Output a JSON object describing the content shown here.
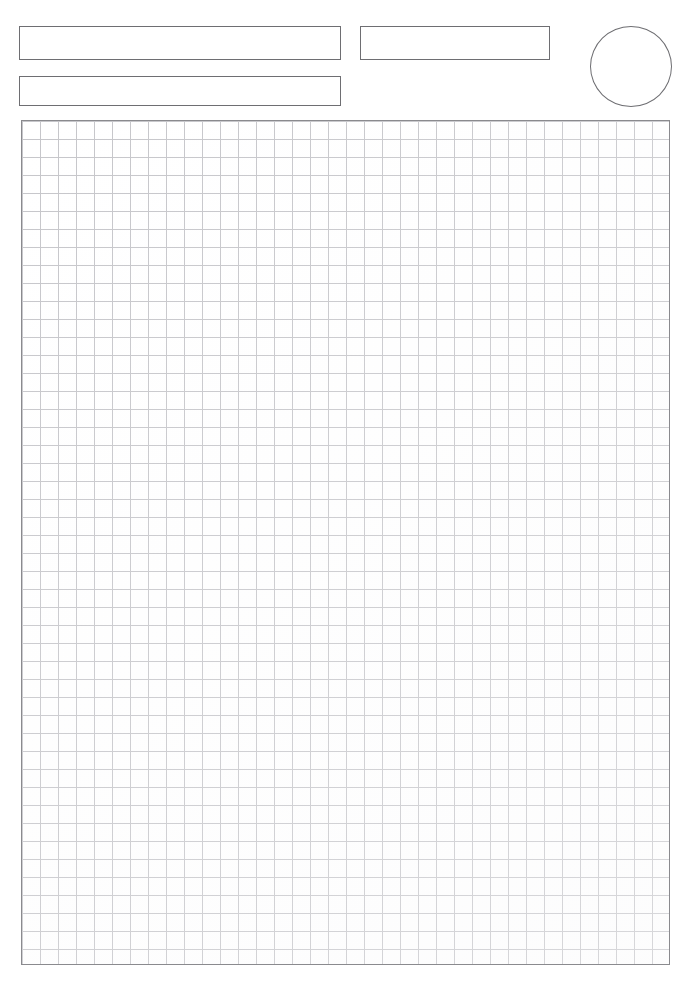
{
  "document": {
    "kind": "blank-grid-worksheet",
    "page_background": "#ffffff",
    "width_px": 697,
    "height_px": 986
  },
  "header": {
    "title_field": {
      "label": "title-field",
      "value": "",
      "placeholder": "",
      "x": 19,
      "y": 26,
      "width": 322,
      "height": 34,
      "border_color": "#6e6e72"
    },
    "subtitle_field": {
      "label": "subtitle-field",
      "value": "",
      "placeholder": "",
      "x": 19,
      "y": 76,
      "width": 322,
      "height": 30,
      "border_color": "#6e6e72"
    },
    "meta_field": {
      "label": "meta-field",
      "value": "",
      "placeholder": "",
      "x": 360,
      "y": 26,
      "width": 190,
      "height": 34,
      "border_color": "#6e6e72"
    },
    "stamp": {
      "label": "stamp-ellipse",
      "value": "",
      "shape": "ellipse",
      "x": 590,
      "y": 26,
      "width": 82,
      "height": 81,
      "border_color": "#6e6e72"
    }
  },
  "grid": {
    "label": "grid-sheet",
    "x": 21,
    "y": 120,
    "width": 649,
    "height": 845,
    "cell_size_px": 18,
    "columns": 36,
    "rows": 47,
    "line_color": "#c6c6ca",
    "border_color": "#8a8a8e",
    "fill_color": "#ffffff",
    "content": ""
  },
  "chart_data": {
    "type": "table",
    "title": "",
    "xlabel": "",
    "ylabel": "",
    "categories": [],
    "values": [],
    "grid": true,
    "note": "Empty squared (graph) paper region; no plotted data present."
  }
}
